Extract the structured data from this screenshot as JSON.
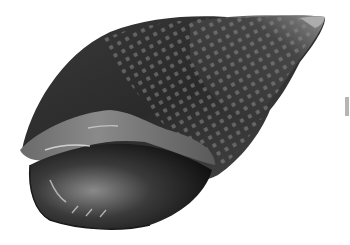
{
  "image": {
    "subject": "Whelk seashell illustration",
    "style": "grayscale",
    "background": "#ffffff"
  },
  "colors": {
    "shell_dark": "#2b2b2b",
    "shell_mid": "#555555",
    "shell_light": "#9a9a9a",
    "lip_light": "#8c8c8c",
    "aperture_dark": "#111111",
    "highlight": "#e6e6e6",
    "edge_bar": "#b5b5b5"
  }
}
